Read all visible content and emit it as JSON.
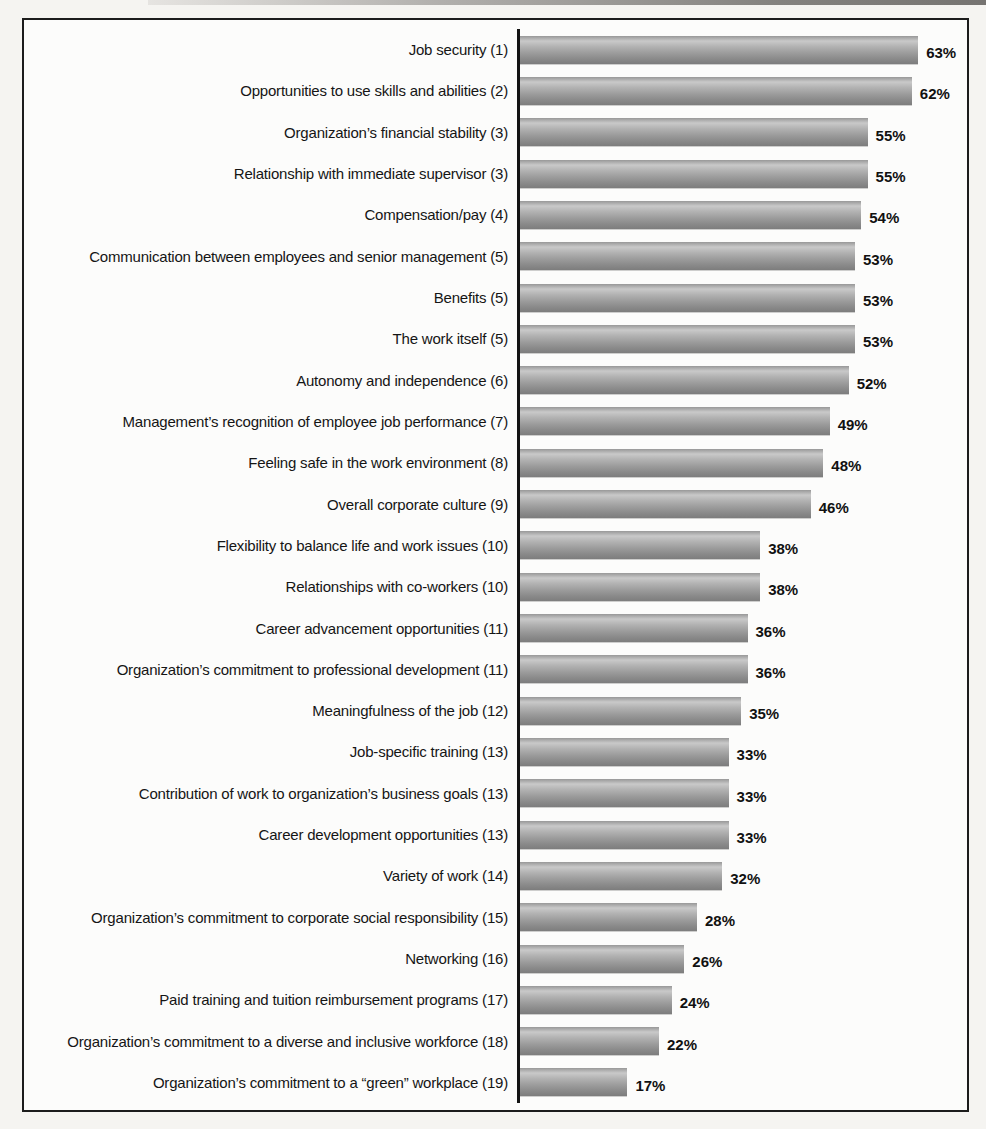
{
  "chart_data": {
    "type": "bar",
    "orientation": "horizontal",
    "title": "",
    "xlabel": "",
    "ylabel": "",
    "value_suffix": "%",
    "xlim": [
      0,
      70
    ],
    "grid": false,
    "legend": false,
    "bar_color_top": "#c9c9c9",
    "bar_color_bottom": "#7d7d7d",
    "axis_color": "#131313",
    "frame_border_color": "#1c1c1c",
    "categories": [
      "Job security (1)",
      "Opportunities to use skills and abilities (2)",
      "Organization’s financial stability (3)",
      "Relationship with immediate supervisor (3)",
      "Compensation/pay (4)",
      "Communication between employees and senior management (5)",
      "Benefits (5)",
      "The work itself (5)",
      "Autonomy and independence (6)",
      "Management’s recognition of employee job performance (7)",
      "Feeling safe in the work environment (8)",
      "Overall corporate culture (9)",
      "Flexibility to balance life and work issues (10)",
      "Relationships with co-workers (10)",
      "Career advancement opportunities (11)",
      "Organization’s commitment to professional development (11)",
      "Meaningfulness of the job (12)",
      "Job-specific training (13)",
      "Contribution of work to organization’s business goals (13)",
      "Career development opportunities (13)",
      "Variety of work (14)",
      "Organization’s commitment to corporate social responsibility (15)",
      "Networking (16)",
      "Paid training and tuition reimbursement programs (17)",
      "Organization’s commitment to a diverse and inclusive workforce (18)",
      "Organization’s commitment to a “green” workplace (19)"
    ],
    "values": [
      63,
      62,
      55,
      55,
      54,
      53,
      53,
      53,
      52,
      49,
      48,
      46,
      38,
      38,
      36,
      36,
      35,
      33,
      33,
      33,
      32,
      28,
      26,
      24,
      22,
      17
    ],
    "value_labels": [
      "63%",
      "62%",
      "55%",
      "55%",
      "54%",
      "53%",
      "53%",
      "53%",
      "52%",
      "49%",
      "48%",
      "46%",
      "38%",
      "38%",
      "36%",
      "36%",
      "35%",
      "33%",
      "33%",
      "33%",
      "32%",
      "28%",
      "26%",
      "24%",
      "22%",
      "17%"
    ]
  }
}
